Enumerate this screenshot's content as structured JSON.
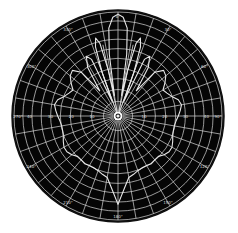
{
  "chart_data": {
    "type": "polar",
    "title": "",
    "center": [
      118,
      116
    ],
    "radius": 104,
    "grid": {
      "rings": 10,
      "spoke_step_deg": 10,
      "ring_color": "#d8d8d8",
      "background": "#050505"
    },
    "angle_labels": [
      "0°",
      "30°",
      "60°",
      "90°",
      "120°",
      "150°",
      "180°",
      "210°",
      "240°",
      "270°",
      "300°",
      "330°"
    ],
    "radial_tick_labels": [
      "10",
      "20",
      "30",
      "40"
    ],
    "series": [
      {
        "name": "pattern",
        "color": "#e8e8e8",
        "angles_deg": [
          0,
          3,
          6,
          8,
          10,
          12,
          14,
          16,
          18,
          20,
          22,
          25,
          28,
          32,
          36,
          40,
          45,
          50,
          55,
          60,
          65,
          70,
          75,
          80,
          85,
          90,
          95,
          100,
          105,
          110,
          115,
          120,
          125,
          130,
          135,
          140,
          145,
          150,
          155,
          160,
          165,
          170,
          175,
          180
        ],
        "values": [
          0.98,
          0.95,
          0.85,
          0.6,
          0.2,
          0.45,
          0.72,
          0.78,
          0.7,
          0.45,
          0.15,
          0.6,
          0.65,
          0.55,
          0.3,
          0.55,
          0.62,
          0.6,
          0.55,
          0.5,
          0.52,
          0.55,
          0.6,
          0.62,
          0.6,
          0.58,
          0.56,
          0.55,
          0.55,
          0.56,
          0.58,
          0.6,
          0.6,
          0.58,
          0.55,
          0.55,
          0.56,
          0.55,
          0.55,
          0.56,
          0.58,
          0.6,
          0.7,
          0.85
        ]
      }
    ]
  }
}
